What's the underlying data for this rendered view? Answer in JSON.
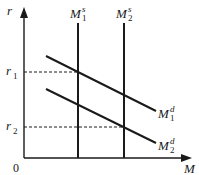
{
  "diagram": {
    "axes": {
      "y_label": "r",
      "x_label": "M",
      "origin_label": "0"
    },
    "y_markers": [
      {
        "label": "r",
        "sub": "1"
      },
      {
        "label": "r",
        "sub": "2"
      }
    ],
    "supply_curves": [
      {
        "label": "M",
        "sup": "s",
        "sub": "1"
      },
      {
        "label": "M",
        "sup": "s",
        "sub": "2"
      }
    ],
    "demand_curves": [
      {
        "label": "M",
        "sup": "d",
        "sub": "1"
      },
      {
        "label": "M",
        "sup": "d",
        "sub": "2"
      }
    ],
    "colors": {
      "line": "#1a1a1a",
      "background": "#ffffff"
    }
  }
}
